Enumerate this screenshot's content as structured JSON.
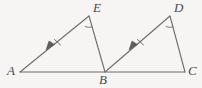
{
  "figure": {
    "width": 202,
    "height": 88,
    "background_color": "#f6f5f3",
    "stroke_color": "#6d6d6d",
    "label_color": "#4a4a4a",
    "labels": {
      "A": "A",
      "B": "B",
      "C": "C",
      "D": "D",
      "E": "E"
    },
    "points": {
      "A": {
        "x": 20,
        "y": 72
      },
      "B": {
        "x": 105,
        "y": 72
      },
      "C": {
        "x": 185,
        "y": 72
      },
      "E": {
        "x": 89,
        "y": 16
      },
      "D": {
        "x": 170,
        "y": 16
      }
    },
    "segments": [
      {
        "name": "segment-AC-baseline",
        "from": "A",
        "to": "C",
        "marks": "none",
        "arrow": false
      },
      {
        "name": "segment-AE",
        "from": "A",
        "to": "E",
        "marks": "single-tick",
        "arrow": true
      },
      {
        "name": "segment-EB",
        "from": "E",
        "to": "B",
        "marks": "none",
        "arrow": false
      },
      {
        "name": "segment-BD",
        "from": "B",
        "to": "D",
        "marks": "single-tick",
        "arrow": true
      },
      {
        "name": "segment-DC",
        "from": "D",
        "to": "C",
        "marks": "none",
        "arrow": false
      }
    ],
    "angle_arcs": [
      {
        "name": "angle-arc-at-E",
        "vertex": "E"
      },
      {
        "name": "angle-arc-at-D",
        "vertex": "D"
      }
    ],
    "triangles": [
      {
        "name": "triangle-ABE",
        "vertices": "ABE"
      },
      {
        "name": "triangle-BCD",
        "vertices": "BCD"
      }
    ]
  }
}
